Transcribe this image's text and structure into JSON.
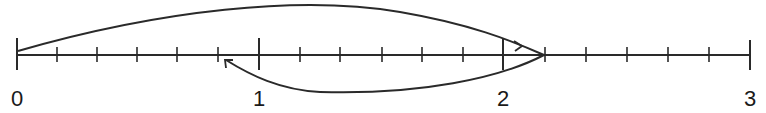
{
  "number_line": {
    "min": 0,
    "max": 3,
    "subdivisions_per_unit": 6,
    "major_labels": [
      "0",
      "1",
      "2",
      "3"
    ],
    "stroke_color": "#2a2a2a"
  },
  "arrows": [
    {
      "name": "forward-jump",
      "from": 0,
      "to": 2.1667,
      "position": "above",
      "arrowhead_at": 2.07
    },
    {
      "name": "backward-jump",
      "from": 2.1667,
      "to": 0.8333,
      "position": "below",
      "arrowhead_at": 0.8333
    }
  ],
  "labels": {
    "l0": "0",
    "l1": "1",
    "l2": "2",
    "l3": "3"
  }
}
